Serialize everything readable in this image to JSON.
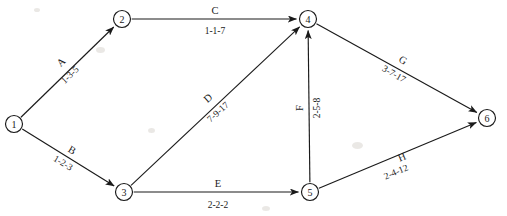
{
  "diagram": {
    "stroke_color": "#1a1a1a",
    "background_color": "#ffffff",
    "width": 507,
    "height": 216
  },
  "nodes": [
    {
      "id": "1",
      "label": "1",
      "x": 14,
      "y": 124,
      "r": 8.5
    },
    {
      "id": "2",
      "label": "2",
      "x": 122,
      "y": 19,
      "r": 8.5
    },
    {
      "id": "3",
      "label": "3",
      "x": 124,
      "y": 192,
      "r": 8.5
    },
    {
      "id": "4",
      "label": "4",
      "x": 308,
      "y": 19,
      "r": 8.5
    },
    {
      "id": "5",
      "label": "5",
      "x": 310,
      "y": 192,
      "r": 8.5
    },
    {
      "id": "6",
      "label": "6",
      "x": 487,
      "y": 118,
      "r": 8.5
    }
  ],
  "edges": [
    {
      "id": "A",
      "name": "A",
      "estimates": "1-3-5",
      "from": "1",
      "to": "2",
      "name_x": 61,
      "name_y": 62,
      "name_rot": -44,
      "est_x": 70,
      "est_y": 75,
      "est_rot": -44
    },
    {
      "id": "B",
      "name": "B",
      "estimates": "1-2-3",
      "from": "1",
      "to": "3",
      "name_x": 72,
      "name_y": 150,
      "name_rot": 31,
      "est_x": 63,
      "est_y": 163,
      "est_rot": 31
    },
    {
      "id": "C",
      "name": "C",
      "estimates": "1-1-7",
      "from": "2",
      "to": "4",
      "name_x": 215,
      "name_y": 10,
      "name_rot": 0,
      "est_x": 215,
      "est_y": 31,
      "est_rot": 0
    },
    {
      "id": "D",
      "name": "D",
      "estimates": "7-9-17",
      "from": "3",
      "to": "4",
      "name_x": 208,
      "name_y": 98,
      "name_rot": -42,
      "est_x": 218,
      "est_y": 112,
      "est_rot": -42
    },
    {
      "id": "E",
      "name": "E",
      "estimates": "2-2-2",
      "from": "3",
      "to": "5",
      "name_x": 218,
      "name_y": 183,
      "name_rot": 0,
      "est_x": 218,
      "est_y": 205,
      "est_rot": 0
    },
    {
      "id": "F",
      "name": "F",
      "estimates": "2-5-8",
      "from": "5",
      "to": "4",
      "name_x": 299,
      "name_y": 108,
      "name_rot": -90,
      "est_x": 317,
      "est_y": 108,
      "est_rot": -90
    },
    {
      "id": "G",
      "name": "G",
      "estimates": "3-7-17",
      "from": "4",
      "to": "6",
      "name_x": 403,
      "name_y": 60,
      "name_rot": 30,
      "est_x": 394,
      "est_y": 74,
      "est_rot": 30
    },
    {
      "id": "H",
      "name": "H",
      "estimates": "2-4-12",
      "from": "5",
      "to": "6",
      "name_x": 402,
      "name_y": 157,
      "name_rot": -23,
      "est_x": 396,
      "est_y": 172,
      "est_rot": -23
    }
  ],
  "chart_data": {
    "type": "diagram",
    "subtype": "activity-on-arrow-network",
    "node_ids": [
      "1",
      "2",
      "3",
      "4",
      "5",
      "6"
    ],
    "activities": [
      {
        "activity": "A",
        "from": 1,
        "to": 2,
        "optimistic": 1,
        "most_likely": 3,
        "pessimistic": 5,
        "label": "1-3-5"
      },
      {
        "activity": "B",
        "from": 1,
        "to": 3,
        "optimistic": 1,
        "most_likely": 2,
        "pessimistic": 3,
        "label": "1-2-3"
      },
      {
        "activity": "C",
        "from": 2,
        "to": 4,
        "optimistic": 1,
        "most_likely": 1,
        "pessimistic": 7,
        "label": "1-1-7"
      },
      {
        "activity": "D",
        "from": 3,
        "to": 4,
        "optimistic": 7,
        "most_likely": 9,
        "pessimistic": 17,
        "label": "7-9-17"
      },
      {
        "activity": "E",
        "from": 3,
        "to": 5,
        "optimistic": 2,
        "most_likely": 2,
        "pessimistic": 2,
        "label": "2-2-2"
      },
      {
        "activity": "F",
        "from": 5,
        "to": 4,
        "optimistic": 2,
        "most_likely": 5,
        "pessimistic": 8,
        "label": "2-5-8"
      },
      {
        "activity": "G",
        "from": 4,
        "to": 6,
        "optimistic": 3,
        "most_likely": 7,
        "pessimistic": 17,
        "label": "3-7-17"
      },
      {
        "activity": "H",
        "from": 5,
        "to": 6,
        "optimistic": 2,
        "most_likely": 4,
        "pessimistic": 12,
        "label": "2-4-12"
      }
    ],
    "estimate_format": "optimistic-most_likely-pessimistic",
    "title": "",
    "legend": []
  }
}
